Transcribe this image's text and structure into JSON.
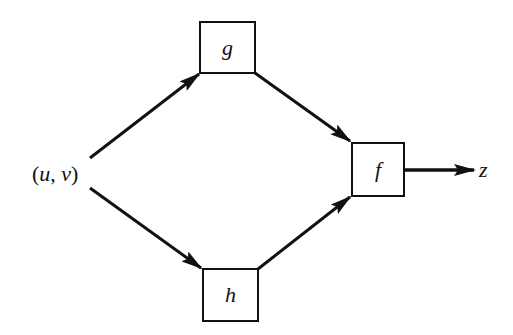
{
  "diagram": {
    "type": "function-composition-flow",
    "input": {
      "label_open": "(",
      "var1": "u",
      "sep": ", ",
      "var2": "v",
      "label_close": ")"
    },
    "nodes": {
      "g": {
        "label": "g"
      },
      "h": {
        "label": "h"
      },
      "f": {
        "label": "f"
      }
    },
    "output": {
      "label": "z"
    },
    "edges": [
      {
        "from": "(u, v)",
        "to": "g"
      },
      {
        "from": "(u, v)",
        "to": "h"
      },
      {
        "from": "g",
        "to": "f"
      },
      {
        "from": "h",
        "to": "f"
      },
      {
        "from": "f",
        "to": "z"
      }
    ],
    "colors": {
      "stroke": "#111111",
      "background": "#ffffff"
    }
  }
}
